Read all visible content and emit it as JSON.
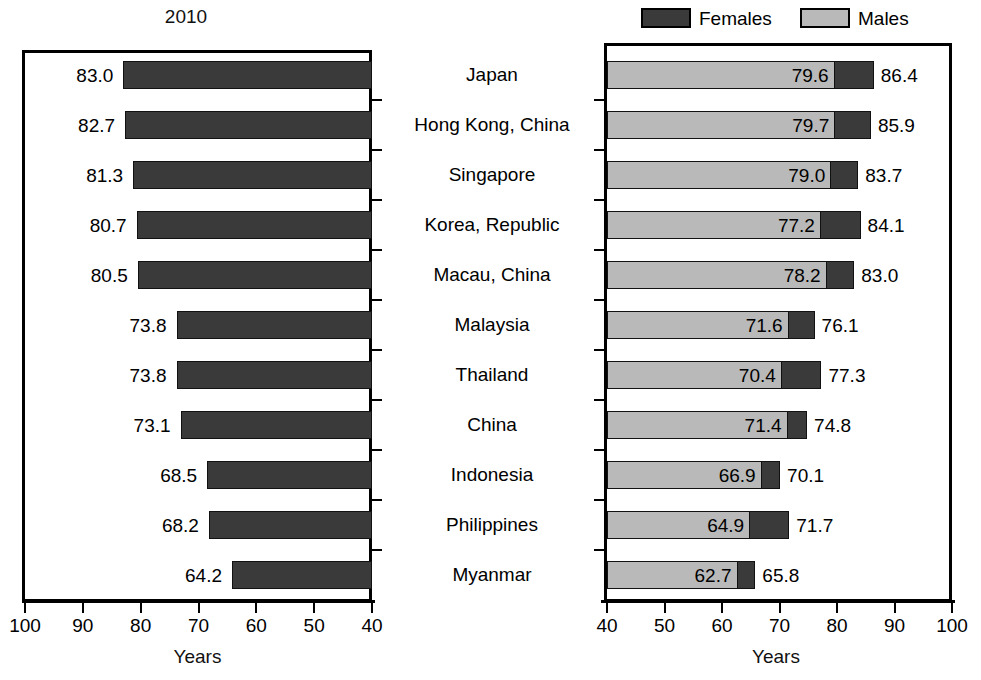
{
  "chart_data": [
    {
      "type": "bar",
      "title": "2010",
      "xlabel": "Years",
      "ylabel": "",
      "orientation": "horizontal",
      "xlim": [
        100,
        40
      ],
      "axis_reversed": true,
      "grid": false,
      "tick_labels": [
        "100",
        "90",
        "80",
        "70",
        "60",
        "50",
        "40"
      ],
      "tick_values": [
        100,
        90,
        80,
        70,
        60,
        50,
        40
      ],
      "categories": [
        "Japan",
        "Hong Kong, China",
        "Singapore",
        "Korea, Republic",
        "Macau, China",
        "Malaysia",
        "Thailand",
        "China",
        "Indonesia",
        "Philippines",
        "Myanmar"
      ],
      "values": [
        83.0,
        82.7,
        81.3,
        80.7,
        80.5,
        73.8,
        73.8,
        73.1,
        68.5,
        68.2,
        64.2
      ],
      "value_labels": [
        "83.0",
        "82.7",
        "81.3",
        "80.7",
        "80.5",
        "73.8",
        "73.8",
        "73.1",
        "68.5",
        "68.2",
        "64.2"
      ],
      "series_name": "Total",
      "bar_color": "#3a3a3a"
    },
    {
      "type": "bar",
      "subtype": "overlapping-horizontal",
      "title": "",
      "xlabel": "Years",
      "ylabel": "",
      "orientation": "horizontal",
      "xlim": [
        40,
        100
      ],
      "axis_reversed": false,
      "grid": false,
      "legend_position": "top",
      "tick_labels": [
        "40",
        "50",
        "60",
        "70",
        "80",
        "90",
        "100"
      ],
      "tick_values": [
        40,
        50,
        60,
        70,
        80,
        90,
        100
      ],
      "categories": [
        "Japan",
        "Hong Kong, China",
        "Singapore",
        "Korea, Republic",
        "Macau, China",
        "Malaysia",
        "Thailand",
        "China",
        "Indonesia",
        "Philippines",
        "Myanmar"
      ],
      "series": [
        {
          "name": "Males",
          "color": "#b9b9b9",
          "values": [
            79.6,
            79.7,
            79.0,
            77.2,
            78.2,
            71.6,
            70.4,
            71.4,
            66.9,
            64.9,
            62.7
          ],
          "value_labels": [
            "79.6",
            "79.7",
            "79.0",
            "77.2",
            "78.2",
            "71.6",
            "70.4",
            "71.4",
            "66.9",
            "64.9",
            "62.7"
          ]
        },
        {
          "name": "Females",
          "color": "#3a3a3a",
          "values": [
            86.4,
            85.9,
            83.7,
            84.1,
            83.0,
            76.1,
            77.3,
            74.8,
            70.1,
            71.7,
            65.8
          ],
          "value_labels": [
            "86.4",
            "85.9",
            "83.7",
            "84.1",
            "83.0",
            "76.1",
            "77.3",
            "74.8",
            "70.1",
            "71.7",
            "65.8"
          ]
        }
      ]
    }
  ],
  "left": {
    "title": "2010",
    "xlabel": "Years",
    "tick_labels": [
      "100",
      "90",
      "80",
      "70",
      "60",
      "50",
      "40"
    ],
    "bars": [
      {
        "label": "83.0"
      },
      {
        "label": "82.7"
      },
      {
        "label": "81.3"
      },
      {
        "label": "80.7"
      },
      {
        "label": "80.5"
      },
      {
        "label": "73.8"
      },
      {
        "label": "73.8"
      },
      {
        "label": "73.1"
      },
      {
        "label": "68.5"
      },
      {
        "label": "68.2"
      },
      {
        "label": "64.2"
      }
    ]
  },
  "countries": [
    {
      "name": "Japan"
    },
    {
      "name": "Hong Kong, China"
    },
    {
      "name": "Singapore"
    },
    {
      "name": "Korea, Republic"
    },
    {
      "name": "Macau, China"
    },
    {
      "name": "Malaysia"
    },
    {
      "name": "Thailand"
    },
    {
      "name": "China"
    },
    {
      "name": "Indonesia"
    },
    {
      "name": "Philippines"
    },
    {
      "name": "Myanmar"
    }
  ],
  "right": {
    "xlabel": "Years",
    "tick_labels": [
      "40",
      "50",
      "60",
      "70",
      "80",
      "90",
      "100"
    ],
    "legend": [
      {
        "label": "Females",
        "color": "#3a3a3a"
      },
      {
        "label": "Males",
        "color": "#b9b9b9"
      }
    ],
    "bars": [
      {
        "male_label": "79.6",
        "total_label": "86.4"
      },
      {
        "male_label": "79.7",
        "total_label": "85.9"
      },
      {
        "male_label": "79.0",
        "total_label": "83.7"
      },
      {
        "male_label": "77.2",
        "total_label": "84.1"
      },
      {
        "male_label": "78.2",
        "total_label": "83.0"
      },
      {
        "male_label": "71.6",
        "total_label": "76.1"
      },
      {
        "male_label": "70.4",
        "total_label": "77.3"
      },
      {
        "male_label": "71.4",
        "total_label": "74.8"
      },
      {
        "male_label": "66.9",
        "total_label": "70.1"
      },
      {
        "male_label": "64.9",
        "total_label": "71.7"
      },
      {
        "male_label": "62.7",
        "total_label": "65.8"
      }
    ]
  }
}
